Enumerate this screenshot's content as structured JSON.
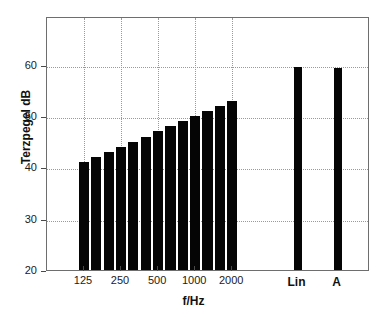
{
  "chart_data": {
    "type": "bar",
    "title": "",
    "xlabel": "f/Hz",
    "ylabel": "Terzpegel dB",
    "ylim": [
      20,
      69.5
    ],
    "yticks": [
      20,
      30,
      40,
      50,
      60
    ],
    "ytick_labels": [
      "20",
      "30",
      "40",
      "50",
      "60"
    ],
    "grid": true,
    "legend": "none",
    "xtick_labels": [
      "125",
      "250",
      "500",
      "1000",
      "2000"
    ],
    "xtick_values": [
      125,
      250,
      500,
      1000,
      2000
    ],
    "categories": [
      100,
      125,
      160,
      200,
      250,
      315,
      400,
      500,
      630,
      800,
      1000,
      1250,
      1600,
      2000,
      "Lin",
      "A"
    ],
    "series": [
      {
        "name": "Terzpegel",
        "bars": [
          {
            "label": "125",
            "value": 41.0
          },
          {
            "label": "160",
            "value": 42.0
          },
          {
            "label": "200",
            "value": 43.0
          },
          {
            "label": "250",
            "value": 44.0
          },
          {
            "label": "315",
            "value": 45.0
          },
          {
            "label": "400",
            "value": 46.0
          },
          {
            "label": "500",
            "value": 47.0
          },
          {
            "label": "630",
            "value": 48.0
          },
          {
            "label": "800",
            "value": 49.0
          },
          {
            "label": "1000",
            "value": 50.0
          },
          {
            "label": "1250",
            "value": 51.0
          },
          {
            "label": "1600",
            "value": 52.0
          },
          {
            "label": "2000",
            "value": 53.0
          }
        ]
      },
      {
        "name": "Summenpegel",
        "bars": [
          {
            "label": "Lin",
            "value": 59.6
          },
          {
            "label": "A",
            "value": 59.3
          }
        ]
      }
    ],
    "summary_labels": [
      "Lin",
      "A"
    ],
    "bar_color": "#050505",
    "grid_color": "#9a9a9a",
    "axis_color": "#6e6e6e"
  }
}
